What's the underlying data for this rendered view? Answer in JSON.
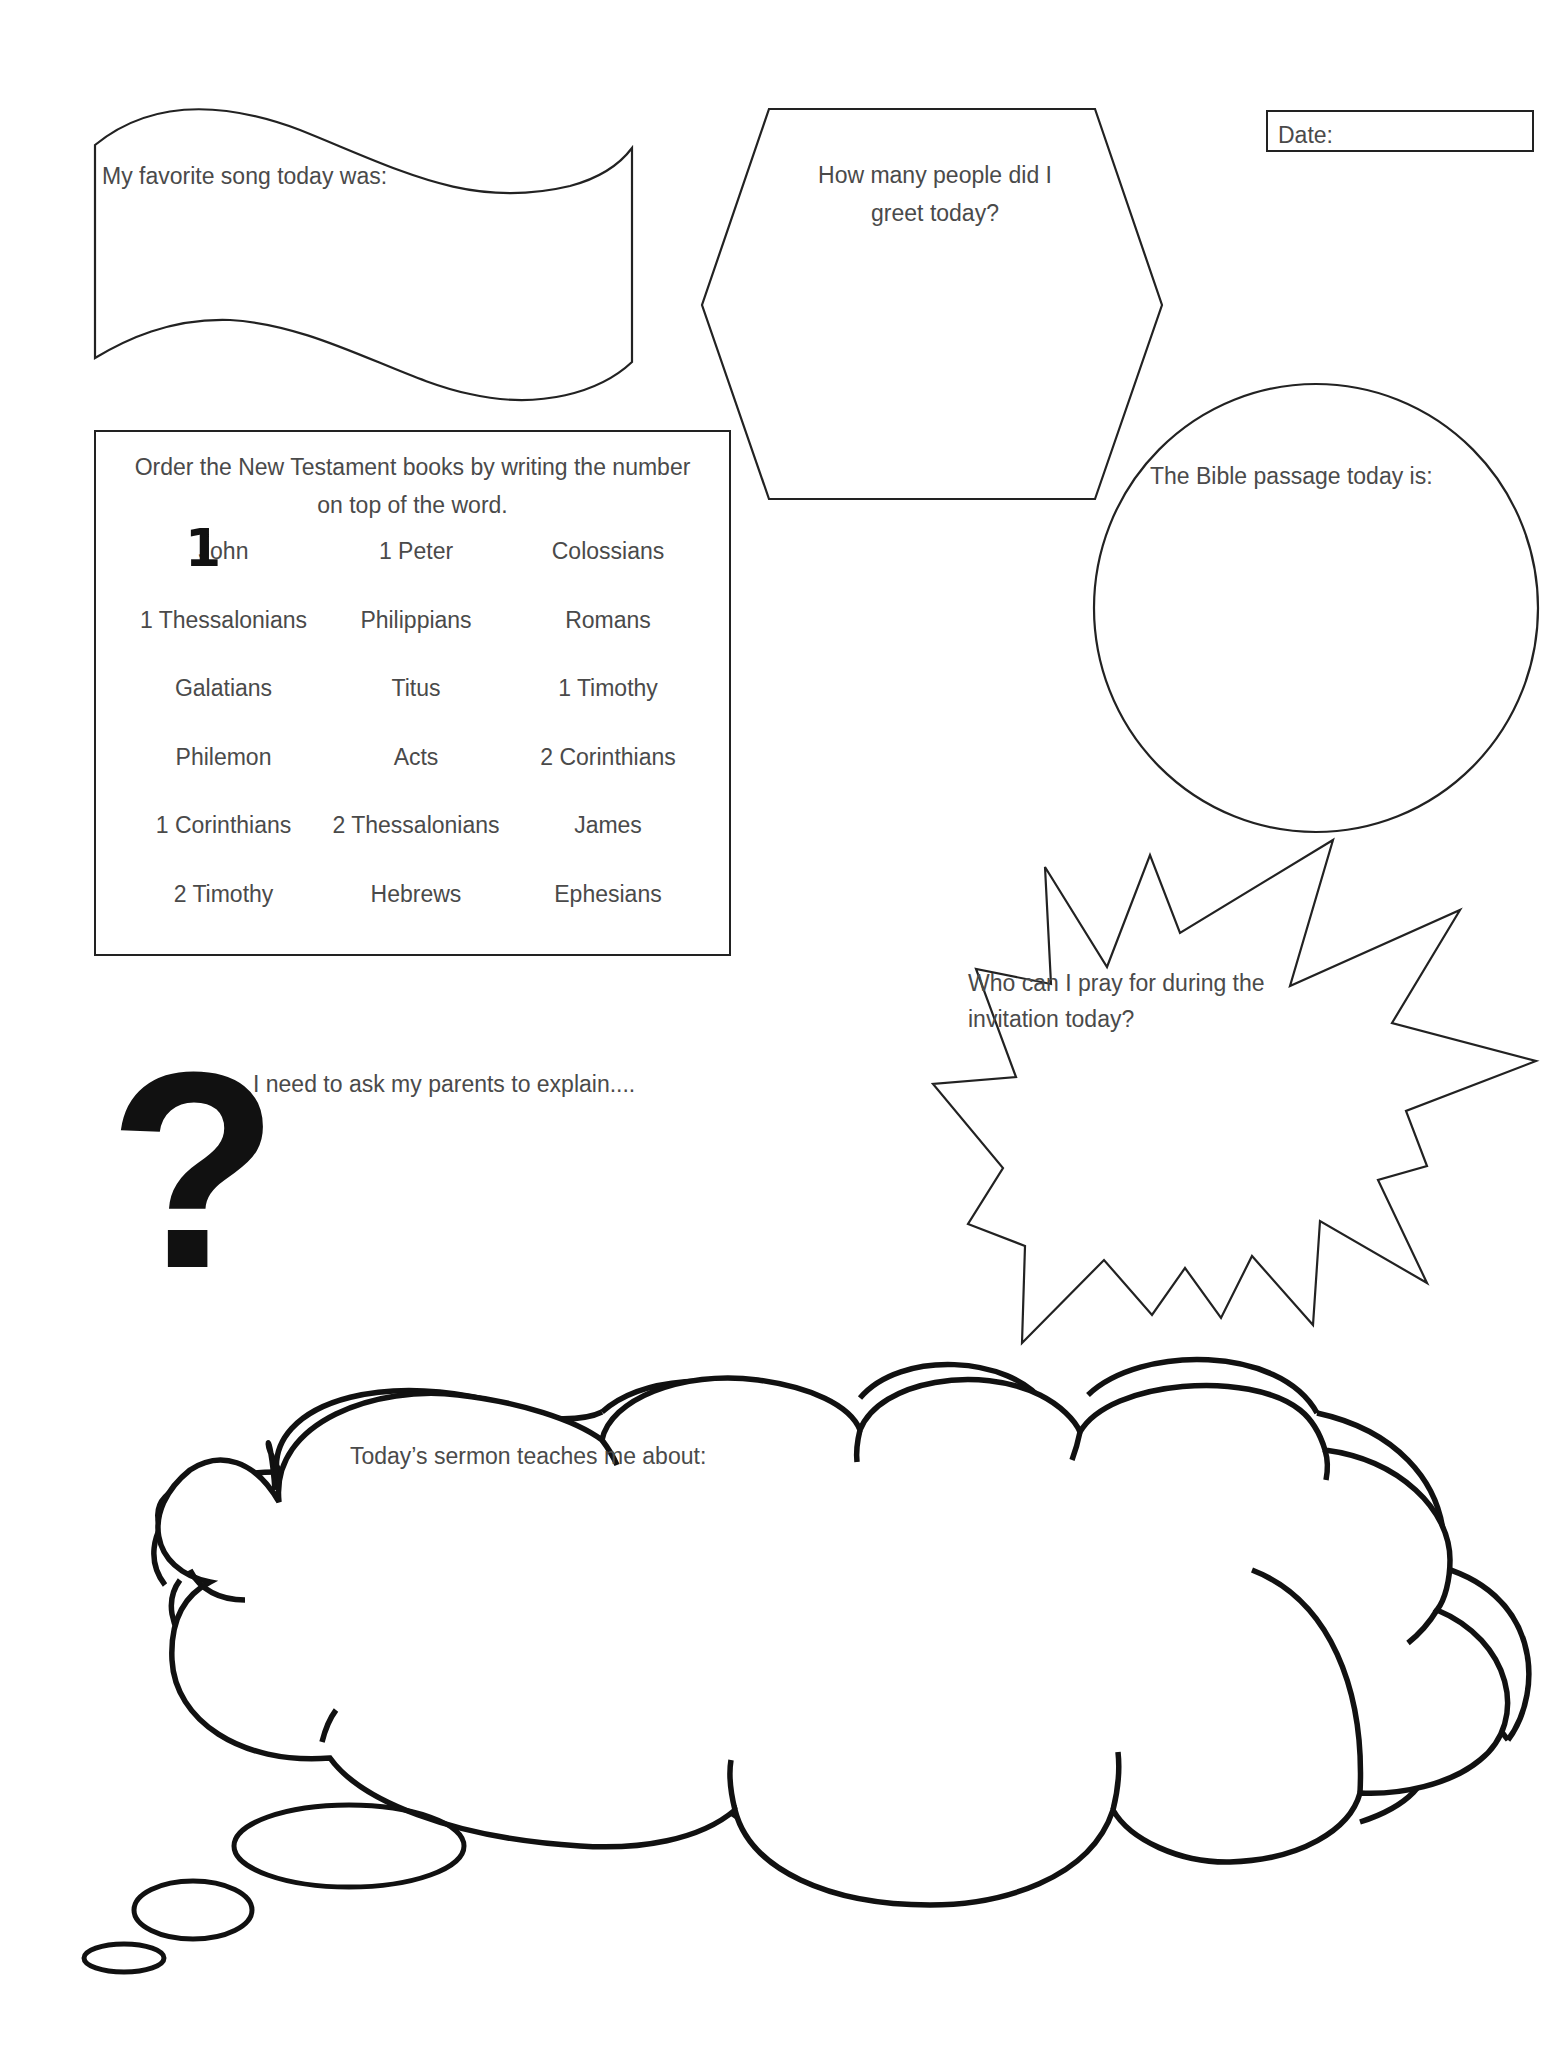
{
  "date_box": {
    "label": "Date:"
  },
  "song_banner": {
    "label": "My favorite song today was:"
  },
  "greet_hexagon": {
    "line1": "How many people did I",
    "line2": "greet today?"
  },
  "bible_circle": {
    "label": "The Bible passage today is:"
  },
  "nt_order": {
    "instruction_line1": "Order the New Testament books by writing the number",
    "instruction_line2": "on top of the word.",
    "handwritten_mark": "1",
    "books": [
      [
        "John",
        "1 Peter",
        "Colossians"
      ],
      [
        "1 Thessalonians",
        "Philippians",
        "Romans"
      ],
      [
        "Galatians",
        "Titus",
        "1 Timothy"
      ],
      [
        "Philemon",
        "Acts",
        "2 Corinthians"
      ],
      [
        "1 Corinthians",
        "2 Thessalonians",
        "James"
      ],
      [
        "2 Timothy",
        "Hebrews",
        "Ephesians"
      ]
    ]
  },
  "pray_starburst": {
    "line1": "Who can I pray for during the",
    "line2": "invitation today?"
  },
  "ask_parents": {
    "icon": "question-mark-icon",
    "glyph": "?",
    "label": "I need to ask my parents to explain...."
  },
  "sermon_cloud": {
    "label": "Today’s sermon teaches me about:"
  }
}
